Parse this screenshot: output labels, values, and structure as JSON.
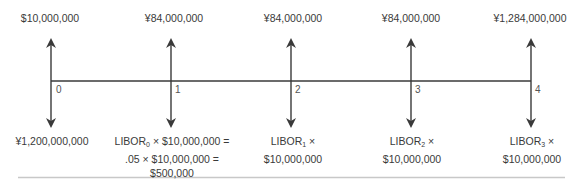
{
  "diagram": {
    "type": "cash-flow timeline",
    "periods": [
      {
        "tick": "0",
        "inflow": "$10,000,000",
        "outflow": {
          "lines": [
            "¥1,200,000,000"
          ]
        }
      },
      {
        "tick": "1",
        "inflow": "¥84,000,000",
        "outflow": {
          "lines": [
            "× $10,000,000 =",
            ".05 × $10,000,000 =",
            "$500,000"
          ],
          "libor_label": "LIBOR",
          "libor_sub": "0"
        }
      },
      {
        "tick": "2",
        "inflow": "¥84,000,000",
        "outflow": {
          "lines": [
            "×",
            "$10,000,000"
          ],
          "libor_label": "LIBOR",
          "libor_sub": "1"
        }
      },
      {
        "tick": "3",
        "inflow": "¥84,000,000",
        "outflow": {
          "lines": [
            "×",
            "$10,000,000"
          ],
          "libor_label": "LIBOR",
          "libor_sub": "2"
        }
      },
      {
        "tick": "4",
        "inflow": "¥1,284,000,000",
        "outflow": {
          "lines": [
            "×",
            "$10,000,000"
          ],
          "libor_label": "LIBOR",
          "libor_sub": "3"
        }
      }
    ],
    "colors": {
      "line": "#3a3a3a",
      "text": "#3a3a3a",
      "rule": "#c8c8c8"
    }
  }
}
